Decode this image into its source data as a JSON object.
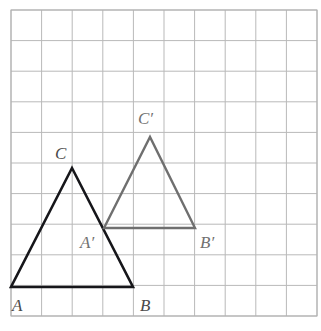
{
  "figure": {
    "kind": "grid-geometry-diagram",
    "canvas": {
      "width": 321,
      "height": 331,
      "background": "#ffffff"
    },
    "grid": {
      "origin_x": 11,
      "origin_y": 10,
      "cell": 30.6,
      "columns": 10,
      "rows": 10,
      "line_color": "#b9b9b9",
      "line_width": 1,
      "border_color": "#b0b0b0"
    },
    "triangles": [
      {
        "name": "triangle-abc",
        "style": "solid",
        "color": "#16161a",
        "stroke_width": 2.6,
        "vertices": [
          {
            "label": "A",
            "x": 11,
            "y": 287,
            "grid": [
              0,
              9
            ]
          },
          {
            "label": "B",
            "x": 133,
            "y": 287,
            "grid": [
              4,
              9
            ]
          },
          {
            "label": "C",
            "x": 72,
            "y": 168,
            "grid": [
              2,
              5.2
            ]
          }
        ]
      },
      {
        "name": "triangle-a-prime-b-prime-c-prime",
        "style": "solid",
        "color": "#6f6f6f",
        "stroke_width": 2.4,
        "vertices": [
          {
            "label": "A'",
            "x": 104,
            "y": 228,
            "grid": [
              3,
              7.1
            ]
          },
          {
            "label": "B'",
            "x": 195,
            "y": 228,
            "grid": [
              6,
              7.1
            ]
          },
          {
            "label": "C'",
            "x": 150,
            "y": 137,
            "grid": [
              4.5,
              4.1
            ]
          }
        ]
      }
    ],
    "labels": [
      {
        "name": "vertex-label-a",
        "text": "A",
        "x": 12,
        "y": 297,
        "color": "dark"
      },
      {
        "name": "vertex-label-b",
        "text": "B",
        "x": 140,
        "y": 297,
        "color": "dark"
      },
      {
        "name": "vertex-label-c",
        "text": "C",
        "x": 55,
        "y": 145,
        "color": "dark"
      },
      {
        "name": "vertex-label-a-prime",
        "text": "A′",
        "x": 80,
        "y": 234,
        "color": "gray"
      },
      {
        "name": "vertex-label-b-prime",
        "text": "B′",
        "x": 200,
        "y": 234,
        "color": "gray"
      },
      {
        "name": "vertex-label-c-prime",
        "text": "C′",
        "x": 138,
        "y": 110,
        "color": "gray"
      }
    ]
  }
}
